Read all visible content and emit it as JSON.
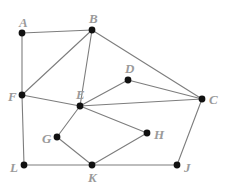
{
  "figure": {
    "width": 228,
    "height": 186,
    "background_color": "#ffffff",
    "edge_color": "#7d7d7d",
    "vertex_color": "#111111",
    "label_color": "#9a9a9a"
  },
  "chart_data": {
    "type": "diagram",
    "subtype": "node-link graph",
    "title": "",
    "directed": false,
    "weighted": false,
    "node_count": 11,
    "edge_count": 17,
    "nodes": [
      {
        "id": "A",
        "label": "A",
        "x": 22,
        "y": 33,
        "label_dx": -3,
        "label_dy": -17
      },
      {
        "id": "B",
        "label": "B",
        "x": 92,
        "y": 30,
        "label_dx": -3,
        "label_dy": -18
      },
      {
        "id": "C",
        "label": "C",
        "x": 202,
        "y": 99,
        "label_dx": 7,
        "label_dy": -6
      },
      {
        "id": "D",
        "label": "D",
        "x": 128,
        "y": 80,
        "label_dx": -3,
        "label_dy": -18
      },
      {
        "id": "E",
        "label": "E",
        "x": 80,
        "y": 106,
        "label_dx": -4,
        "label_dy": -18
      },
      {
        "id": "F",
        "label": "F",
        "x": 22,
        "y": 95,
        "label_dx": -14,
        "label_dy": -5
      },
      {
        "id": "G",
        "label": "G",
        "x": 57,
        "y": 137,
        "label_dx": -15,
        "label_dy": -5
      },
      {
        "id": "H",
        "label": "H",
        "x": 147,
        "y": 133,
        "label_dx": 7,
        "label_dy": -5
      },
      {
        "id": "J",
        "label": "J",
        "x": 177,
        "y": 165,
        "label_dx": 7,
        "label_dy": -4
      },
      {
        "id": "K",
        "label": "K",
        "x": 92,
        "y": 165,
        "label_dx": -4,
        "label_dy": 6
      },
      {
        "id": "L",
        "label": "L",
        "x": 24,
        "y": 165,
        "label_dx": -14,
        "label_dy": -4
      }
    ],
    "edges": [
      {
        "source": "A",
        "target": "B"
      },
      {
        "source": "A",
        "target": "F"
      },
      {
        "source": "B",
        "target": "F"
      },
      {
        "source": "B",
        "target": "E"
      },
      {
        "source": "B",
        "target": "C"
      },
      {
        "source": "F",
        "target": "E"
      },
      {
        "source": "F",
        "target": "L"
      },
      {
        "source": "E",
        "target": "D"
      },
      {
        "source": "E",
        "target": "C"
      },
      {
        "source": "E",
        "target": "G"
      },
      {
        "source": "E",
        "target": "H"
      },
      {
        "source": "D",
        "target": "C"
      },
      {
        "source": "C",
        "target": "J"
      },
      {
        "source": "G",
        "target": "K"
      },
      {
        "source": "H",
        "target": "K"
      },
      {
        "source": "L",
        "target": "K"
      },
      {
        "source": "K",
        "target": "J"
      }
    ],
    "adjacency": {
      "A": [
        "B",
        "F"
      ],
      "B": [
        "A",
        "F",
        "E",
        "C"
      ],
      "C": [
        "B",
        "E",
        "D",
        "J"
      ],
      "D": [
        "E",
        "C"
      ],
      "E": [
        "B",
        "F",
        "D",
        "C",
        "G",
        "H"
      ],
      "F": [
        "A",
        "B",
        "E",
        "L"
      ],
      "G": [
        "E",
        "K"
      ],
      "H": [
        "E",
        "K"
      ],
      "J": [
        "C",
        "K"
      ],
      "K": [
        "G",
        "H",
        "L",
        "J"
      ],
      "L": [
        "F",
        "K"
      ]
    }
  }
}
